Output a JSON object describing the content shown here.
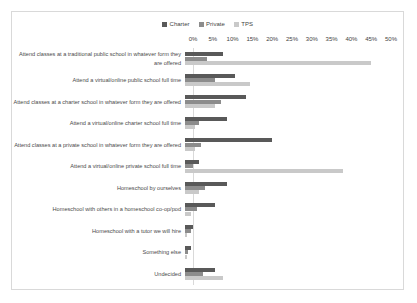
{
  "chart": {
    "type": "bar",
    "orientation": "horizontal",
    "grouping": "grouped",
    "title": "",
    "xlabel": "",
    "ylabel": "",
    "grid": false,
    "legend_position": "top-center"
  },
  "legend": {
    "entries": [
      {
        "name": "Charter",
        "color": "#595959"
      },
      {
        "name": "Private",
        "color": "#8c8c8c"
      },
      {
        "name": "TPS",
        "color": "#c9c9c9"
      }
    ]
  },
  "axis": {
    "ticks": [
      "0%",
      "5%",
      "10%",
      "15%",
      "20%",
      "25%",
      "30%",
      "35%",
      "40%",
      "45%",
      "50%"
    ],
    "min": 0,
    "max": 50,
    "step": 5
  },
  "chart_data": {
    "type": "bar",
    "title": "",
    "xlabel": "",
    "ylabel": "",
    "xlim": [
      0,
      50
    ],
    "grid": false,
    "legend_position": "top-center",
    "categories": [
      "Attend classes at a traditional public school in whatever form they are offered",
      "Attend a virtual/online public school full time",
      "Attend classes at a charter school in whatever form they are offered",
      "Attend a virtual/online charter school full time",
      "Attend classes at a private school in whatever form they are offered",
      "Attend a virtual/online private school full time",
      "Homeschool by ourselves",
      "Homeschool with others in a homeschool co-op/pod",
      "Homeschool with a tutor we will hire",
      "Something else",
      "Undecided"
    ],
    "series": [
      {
        "name": "Charter",
        "color": "#595959",
        "values": [
          9.5,
          12.5,
          15.5,
          10.5,
          22.0,
          3.5,
          10.5,
          7.5,
          2.0,
          1.5,
          7.5
        ]
      },
      {
        "name": "Private",
        "color": "#8c8c8c",
        "values": [
          5.5,
          7.5,
          9.0,
          3.5,
          4.0,
          2.0,
          5.0,
          3.0,
          1.5,
          0.8,
          4.5
        ]
      },
      {
        "name": "TPS",
        "color": "#c9c9c9",
        "values": [
          47.0,
          16.5,
          7.5,
          2.5,
          2.5,
          40.0,
          3.5,
          1.5,
          0.5,
          0.5,
          9.5
        ]
      }
    ]
  }
}
